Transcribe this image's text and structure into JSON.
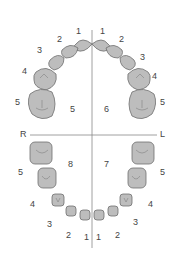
{
  "diagram": {
    "type": "dental-arch-chart",
    "axis_labels": {
      "right": "R",
      "left": "L"
    },
    "quadrants": [
      {
        "id": "upper-right",
        "label": "5"
      },
      {
        "id": "upper-left",
        "label": "6"
      },
      {
        "id": "lower-left",
        "label": "7"
      },
      {
        "id": "lower-right",
        "label": "8"
      }
    ],
    "upper_teeth_labels": {
      "right": [
        "1",
        "2",
        "3",
        "4",
        "5"
      ],
      "left": [
        "1",
        "2",
        "3",
        "4",
        "5"
      ]
    },
    "lower_teeth_labels": {
      "right": [
        "1",
        "2",
        "3",
        "4",
        "5"
      ],
      "left": [
        "1",
        "2",
        "3",
        "4",
        "5"
      ]
    },
    "colors": {
      "tooth_fill": "#bdbdbd",
      "tooth_stroke": "#6e6e6e",
      "axis": "#888888",
      "text": "#444444"
    }
  }
}
